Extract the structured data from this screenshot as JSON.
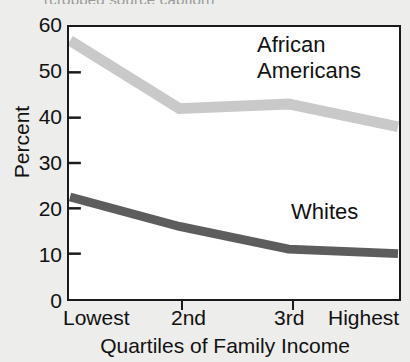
{
  "source_title": "(cropped source caption)",
  "axes": {
    "y_title": "Percent",
    "y_ticks": [
      "60",
      "50",
      "40",
      "30",
      "20",
      "10",
      "0"
    ],
    "x_title": "Quartiles of Family Income",
    "x_ticks": [
      "Lowest",
      "2nd",
      "3rd",
      "Highest"
    ]
  },
  "annotations": {
    "african_line1": "African",
    "african_line2": "Americans",
    "whites": "Whites"
  },
  "colors": {
    "african_americans": "#c9c9c9",
    "whites": "#5d5d5d",
    "frame": "#1a1a1a",
    "plot_background": "#ffffff",
    "page_background": "#ededeb"
  },
  "chart_data": {
    "type": "line",
    "title": "",
    "xlabel": "Quartiles of Family Income",
    "ylabel": "Percent",
    "categories": [
      "Lowest",
      "2nd",
      "3rd",
      "Highest"
    ],
    "ylim": [
      0,
      60
    ],
    "yticks": [
      0,
      10,
      20,
      30,
      40,
      50,
      60
    ],
    "grid": false,
    "legend": "inline-annotations",
    "series": [
      {
        "name": "African Americans",
        "color": "#c9c9c9",
        "values": [
          57,
          42,
          43,
          38
        ]
      },
      {
        "name": "Whites",
        "color": "#5d5d5d",
        "values": [
          22.5,
          16,
          11,
          10
        ]
      }
    ]
  }
}
